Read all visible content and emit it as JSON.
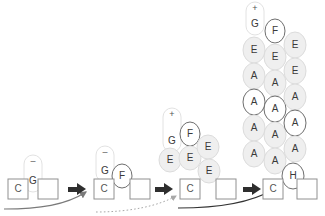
{
  "diagram": {
    "background_color": "#ffffff",
    "ellipse_fill": "#efefef",
    "ellipse_stroke": "#dcdcdc",
    "ellipse_stroke_dark": "#6e6e6e",
    "square_fill": "#ffffff",
    "square_stroke": "#909090",
    "text_color": "#3a3a3a",
    "arrow_color": "#2e2e2e",
    "curve_color_solid": "#666666",
    "curve_color_dotted": "#aaaaaa",
    "curve_color_dark": "#333333"
  },
  "groups": [
    {
      "id": "group-1",
      "squares": [
        {
          "label": "C",
          "x": 8,
          "y": 179,
          "w": 20,
          "h": 20
        },
        {
          "label": "",
          "x": 38,
          "y": 179,
          "w": 20,
          "h": 20
        }
      ],
      "capsule": {
        "label": "G",
        "charge": "–",
        "cx": 33,
        "cy": 181,
        "rx": 9,
        "top": 155
      },
      "ellipses": []
    },
    {
      "id": "group-2",
      "squares": [
        {
          "label": "C",
          "x": 94,
          "y": 179,
          "w": 20,
          "h": 20
        },
        {
          "label": "",
          "x": 130,
          "y": 179,
          "w": 20,
          "h": 20
        }
      ],
      "capsule": {
        "label": "G",
        "charge": "–",
        "cx": 105,
        "cy": 171,
        "rx": 9,
        "top": 146
      },
      "ellipses": [
        {
          "label": "F",
          "cx": 122,
          "cy": 176,
          "rx": 10,
          "ry": 12,
          "dark": true
        }
      ]
    },
    {
      "id": "group-3",
      "squares": [
        {
          "label": "C",
          "x": 180,
          "y": 179,
          "w": 20,
          "h": 20
        },
        {
          "label": "",
          "x": 216,
          "y": 179,
          "w": 20,
          "h": 20
        }
      ],
      "capsule": {
        "label": "G",
        "charge": "+",
        "cx": 172,
        "cy": 141,
        "rx": 9,
        "top": 108
      },
      "ellipses": [
        {
          "label": "E",
          "cx": 170,
          "cy": 160,
          "rx": 11,
          "ry": 12,
          "dark": false
        },
        {
          "label": "F",
          "cx": 190,
          "cy": 134,
          "rx": 10,
          "ry": 12,
          "dark": true
        },
        {
          "label": "E",
          "cx": 190,
          "cy": 158,
          "rx": 11,
          "ry": 12,
          "dark": false
        },
        {
          "label": "E",
          "cx": 208,
          "cy": 147,
          "rx": 11,
          "ry": 12,
          "dark": false
        },
        {
          "label": "E",
          "cx": 209,
          "cy": 171,
          "rx": 11,
          "ry": 12,
          "dark": false
        }
      ]
    },
    {
      "id": "group-4",
      "squares": [
        {
          "label": "C",
          "x": 263,
          "y": 179,
          "w": 20,
          "h": 20
        },
        {
          "label": "",
          "x": 297,
          "y": 179,
          "w": 20,
          "h": 20
        }
      ],
      "capsule": {
        "label": "G",
        "charge": "+",
        "cx": 255,
        "cy": 24,
        "rx": 9,
        "top": 2
      },
      "ellipses": [
        {
          "label": "E",
          "cx": 254,
          "cy": 50,
          "rx": 11,
          "ry": 13,
          "dark": false
        },
        {
          "label": "A",
          "cx": 254,
          "cy": 76,
          "rx": 11,
          "ry": 13,
          "dark": false
        },
        {
          "label": "A",
          "cx": 254,
          "cy": 102,
          "rx": 11,
          "ry": 13,
          "dark": true
        },
        {
          "label": "A",
          "cx": 254,
          "cy": 128,
          "rx": 11,
          "ry": 13,
          "dark": false
        },
        {
          "label": "A",
          "cx": 254,
          "cy": 154,
          "rx": 11,
          "ry": 13,
          "dark": false
        },
        {
          "label": "F",
          "cx": 275,
          "cy": 31,
          "rx": 10,
          "ry": 12,
          "dark": true
        },
        {
          "label": "E",
          "cx": 275,
          "cy": 57,
          "rx": 11,
          "ry": 13,
          "dark": false
        },
        {
          "label": "A",
          "cx": 275,
          "cy": 83,
          "rx": 11,
          "ry": 13,
          "dark": false
        },
        {
          "label": "A",
          "cx": 275,
          "cy": 109,
          "rx": 11,
          "ry": 13,
          "dark": true
        },
        {
          "label": "A",
          "cx": 275,
          "cy": 135,
          "rx": 11,
          "ry": 13,
          "dark": false
        },
        {
          "label": "A",
          "cx": 275,
          "cy": 161,
          "rx": 11,
          "ry": 13,
          "dark": false
        },
        {
          "label": "E",
          "cx": 295,
          "cy": 45,
          "rx": 11,
          "ry": 13,
          "dark": false
        },
        {
          "label": "E",
          "cx": 295,
          "cy": 71,
          "rx": 11,
          "ry": 13,
          "dark": false
        },
        {
          "label": "A",
          "cx": 295,
          "cy": 97,
          "rx": 11,
          "ry": 13,
          "dark": false
        },
        {
          "label": "A",
          "cx": 295,
          "cy": 123,
          "rx": 11,
          "ry": 13,
          "dark": true
        },
        {
          "label": "A",
          "cx": 295,
          "cy": 149,
          "rx": 11,
          "ry": 13,
          "dark": false
        },
        {
          "label": "H",
          "cx": 293,
          "cy": 176,
          "rx": 11,
          "ry": 13,
          "dark": true
        }
      ]
    }
  ],
  "step_arrows": [
    {
      "id": "step-arrow-1",
      "x": 68,
      "y": 189
    },
    {
      "id": "step-arrow-2",
      "x": 155,
      "y": 189
    },
    {
      "id": "step-arrow-3",
      "x": 243,
      "y": 189
    }
  ],
  "curved_arrows": [
    {
      "id": "curve-arrow-1",
      "style": "solid",
      "path": "M 4 209 C 40 209 66 205 86 192",
      "color": "#7a7a7a"
    },
    {
      "id": "curve-arrow-2",
      "style": "dotted",
      "path": "M 96 212 C 130 212 158 206 176 196",
      "color": "#a8a8a8"
    },
    {
      "id": "curve-arrow-3",
      "style": "solid",
      "path": "M 178 208 C 220 208 252 202 272 190",
      "color": "#333333"
    }
  ]
}
